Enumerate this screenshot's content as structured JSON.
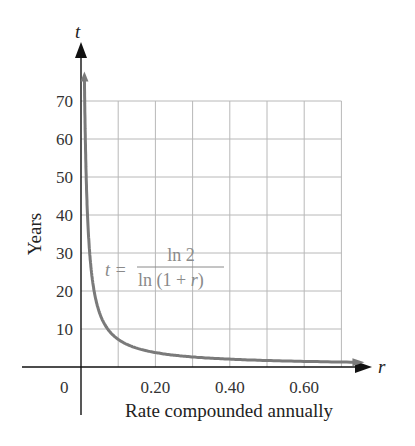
{
  "chart_data": {
    "type": "line",
    "title": "",
    "xlabel": "Rate compounded annually",
    "ylabel": "Years",
    "x_axis_var": "r",
    "y_axis_var": "t",
    "xlim": [
      0,
      0.75
    ],
    "ylim": [
      0,
      78
    ],
    "x_ticks": [
      0.2,
      0.4,
      0.6
    ],
    "x_tick_labels": [
      "0.20",
      "0.40",
      "0.60"
    ],
    "y_ticks": [
      10,
      20,
      30,
      40,
      50,
      60,
      70
    ],
    "y_tick_labels": [
      "10",
      "20",
      "30",
      "40",
      "50",
      "60",
      "70"
    ],
    "origin_label": "0",
    "grid": true,
    "grid_x_step": 0.1,
    "grid_y_step": 10,
    "annotation": {
      "lhs": "t =",
      "numerator": "ln 2",
      "denominator_pre": "ln (1 + ",
      "denominator_var": "r",
      "denominator_post": ")"
    },
    "series": [
      {
        "name": "t = ln 2 / ln(1 + r)",
        "color": "#7a7a7a",
        "x": [
          0.009,
          0.01,
          0.015,
          0.02,
          0.03,
          0.04,
          0.05,
          0.06,
          0.08,
          0.1,
          0.12,
          0.15,
          0.2,
          0.25,
          0.3,
          0.35,
          0.4,
          0.45,
          0.5,
          0.55,
          0.6,
          0.65,
          0.7,
          0.74
        ],
        "y": [
          77.4,
          69.7,
          46.6,
          35.0,
          23.4,
          17.7,
          14.2,
          11.9,
          9.0,
          7.3,
          6.1,
          5.0,
          3.8,
          3.1,
          2.6,
          2.3,
          2.1,
          1.9,
          1.7,
          1.6,
          1.5,
          1.4,
          1.3,
          1.2
        ]
      }
    ]
  },
  "colors": {
    "axis": "#111111",
    "grid": "#b8b8b8",
    "curve": "#7a7a7a",
    "formula": "#8a8a8a"
  }
}
